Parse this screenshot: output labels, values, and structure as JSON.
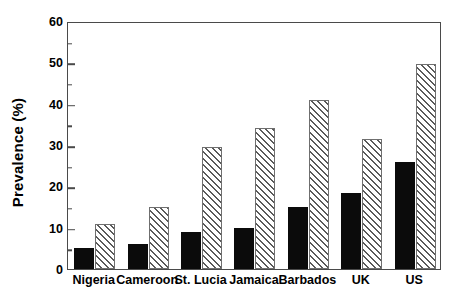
{
  "chart_data": {
    "type": "bar",
    "title": "",
    "xlabel": "",
    "ylabel": "Prevalence (%)",
    "categories": [
      "Nigeria",
      "Cameroon",
      "St. Lucia",
      "Jamaica",
      "Barbados",
      "UK",
      "US"
    ],
    "series": [
      {
        "name": "solid-black",
        "fill": "solid-black",
        "values": [
          5,
          6,
          9,
          10,
          15,
          18.5,
          26
        ]
      },
      {
        "name": "hatched-white",
        "fill": "diagonal-hatch",
        "values": [
          11,
          15,
          29.5,
          34,
          41,
          31.5,
          49.5
        ]
      }
    ],
    "ylim": [
      0,
      60
    ],
    "ytick_labels": [
      "0",
      "10",
      "20",
      "30",
      "40",
      "50",
      "60"
    ],
    "ytick_values": [
      0,
      10,
      20,
      30,
      40,
      50,
      60
    ],
    "yminor_values": [
      5,
      15,
      25,
      35,
      45,
      55
    ],
    "grid": false,
    "legend": "none",
    "axis_color": "#4a4a4a",
    "bar_solid_color": "#0b0b0b",
    "bar_hatch_color": "#5a5a5a",
    "background_color": "#ffffff"
  }
}
